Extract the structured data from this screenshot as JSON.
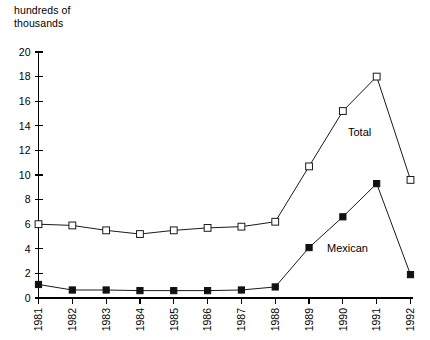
{
  "chart_data": {
    "type": "line",
    "title": "",
    "ylabel": "hundreds of\nthousands",
    "ylabel_line1": "hundreds of",
    "ylabel_line2": "thousands",
    "xlabel": "",
    "categories": [
      "1981",
      "1982",
      "1983",
      "1984",
      "1985",
      "1986",
      "1987",
      "1988",
      "1989",
      "1990",
      "1991",
      "1992"
    ],
    "ylim": [
      0,
      20
    ],
    "yticks": [
      0,
      2,
      4,
      6,
      8,
      10,
      12,
      14,
      16,
      18,
      20
    ],
    "ytick_labels": [
      "0",
      "2",
      "4",
      "6",
      "8",
      "10",
      "12",
      "14",
      "16",
      "18",
      "20"
    ],
    "grid": false,
    "legend_position": "inline-annotation",
    "series": [
      {
        "name": "Total",
        "marker": "open-square",
        "label_annotation": "Total",
        "values": [
          6.0,
          5.9,
          5.5,
          5.2,
          5.5,
          5.7,
          5.8,
          6.2,
          10.7,
          15.2,
          18.0,
          9.6
        ]
      },
      {
        "name": "Mexican",
        "marker": "filled-square",
        "label_annotation": "Mexican",
        "values": [
          1.1,
          0.65,
          0.65,
          0.6,
          0.6,
          0.6,
          0.65,
          0.9,
          4.1,
          6.6,
          9.3,
          1.9
        ]
      }
    ]
  },
  "colors": {
    "axis": "#000000",
    "line": "#1a1a1a",
    "background": "#ffffff",
    "marker_open_fill": "#ffffff",
    "marker_filled_fill": "#111111"
  }
}
